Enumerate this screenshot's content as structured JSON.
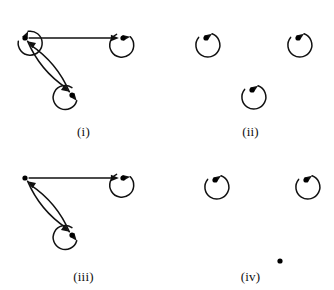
{
  "figure": {
    "type": "directed-graph-set",
    "background_color": "#ffffff",
    "ink_color": "#111111",
    "node_color": "#000000",
    "node_radius": 2.6,
    "edge_width": 1.5,
    "loop_radius": 12,
    "panel_count": 4,
    "panel_width": 167,
    "panel_height": 145
  },
  "panels": [
    {
      "id": "i",
      "label": "(i)",
      "description": "Three vertices; each vertex has a self-loop; a directed edge from vertex a to vertex b; a pair of opposite directed edges between vertex a and vertex c.",
      "vertices": [
        {
          "id": "a",
          "name": "vertex-a",
          "x": 25,
          "y": 38,
          "loop": true,
          "loop_angle_deg": 135,
          "loop_arrow": "into-node-from-upper-left"
        },
        {
          "id": "b",
          "name": "vertex-b",
          "x": 123,
          "y": 38,
          "loop": true,
          "loop_angle_deg": 80,
          "loop_arrow": "into-node-from-right"
        },
        {
          "id": "c",
          "name": "vertex-c",
          "x": 72,
          "y": 95,
          "loop": true,
          "loop_angle_deg": 20,
          "loop_arrow": "into-node-from-below"
        }
      ],
      "edges": [
        {
          "from": "a",
          "to": "b",
          "style": "straight",
          "curve": 0,
          "name": "edge-a-to-b"
        },
        {
          "from": "a",
          "to": "c",
          "style": "curved",
          "curve": 9,
          "name": "edge-a-to-c"
        },
        {
          "from": "c",
          "to": "a",
          "style": "curved",
          "curve": 9,
          "name": "edge-c-to-a"
        }
      ],
      "loop_count": 3,
      "edge_count": 3
    },
    {
      "id": "ii",
      "label": "(ii)",
      "description": "Three isolated vertices; each vertex has a self-loop; no edges between distinct vertices.",
      "vertices": [
        {
          "id": "a",
          "name": "vertex-a",
          "x": 39,
          "y": 38,
          "loop": true,
          "loop_angle_deg": 105,
          "loop_arrow": "into-node-from-right"
        },
        {
          "id": "b",
          "name": "vertex-b",
          "x": 131,
          "y": 38,
          "loop": true,
          "loop_angle_deg": 105,
          "loop_arrow": "into-node-from-right"
        },
        {
          "id": "c",
          "name": "vertex-c",
          "x": 85,
          "y": 90,
          "loop": true,
          "loop_angle_deg": 105,
          "loop_arrow": "into-node-from-right"
        }
      ],
      "edges": [],
      "loop_count": 3,
      "edge_count": 0
    },
    {
      "id": "iii",
      "label": "(iii)",
      "description": "Three vertices; vertex a has no self-loop; vertices b and c have self-loops; a directed edge from vertex a to vertex b; a pair of opposite directed edges between vertex a and vertex c.",
      "vertices": [
        {
          "id": "a",
          "name": "vertex-a",
          "x": 25,
          "y": 33,
          "loop": false,
          "loop_angle_deg": 0,
          "loop_arrow": "none"
        },
        {
          "id": "b",
          "name": "vertex-b",
          "x": 123,
          "y": 33,
          "loop": true,
          "loop_angle_deg": 80,
          "loop_arrow": "into-node-from-right"
        },
        {
          "id": "c",
          "name": "vertex-c",
          "x": 72,
          "y": 90,
          "loop": true,
          "loop_angle_deg": 20,
          "loop_arrow": "into-node-from-below"
        }
      ],
      "edges": [
        {
          "from": "a",
          "to": "b",
          "style": "straight",
          "curve": 0,
          "name": "edge-a-to-b"
        },
        {
          "from": "a",
          "to": "c",
          "style": "curved",
          "curve": 9,
          "name": "edge-a-to-c"
        },
        {
          "from": "c",
          "to": "a",
          "style": "curved",
          "curve": 9,
          "name": "edge-c-to-a"
        }
      ],
      "loop_count": 2,
      "edge_count": 3
    },
    {
      "id": "iv",
      "label": "(iv)",
      "description": "Three isolated vertices; the two upper vertices have self-loops; the lower vertex has no self-loop and no edges.",
      "vertices": [
        {
          "id": "a",
          "name": "vertex-a",
          "x": 48,
          "y": 35,
          "loop": true,
          "loop_angle_deg": 105,
          "loop_arrow": "into-node-from-right"
        },
        {
          "id": "b",
          "name": "vertex-b",
          "x": 139,
          "y": 35,
          "loop": true,
          "loop_angle_deg": 105,
          "loop_arrow": "into-node-from-right"
        },
        {
          "id": "c",
          "name": "vertex-c",
          "x": 113,
          "y": 116,
          "loop": false,
          "loop_angle_deg": 0,
          "loop_arrow": "none"
        }
      ],
      "edges": [],
      "loop_count": 2,
      "edge_count": 0
    }
  ]
}
